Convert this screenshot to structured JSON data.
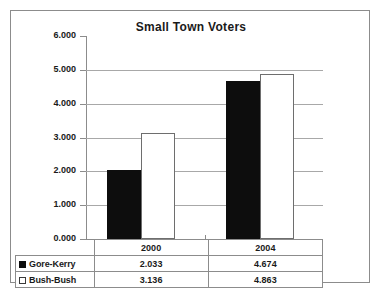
{
  "chart_data": {
    "type": "bar",
    "title": "Small Town Voters",
    "xlabel": "",
    "ylabel": "",
    "categories": [
      "2000",
      "2004"
    ],
    "series": [
      {
        "name": "Gore-Kerry",
        "values": [
          2.033,
          3.136
        ],
        "marker": "filled-square",
        "color": "#0d0d0d"
      },
      {
        "name": "Bush-Bush",
        "values": [
          4.674,
          4.863
        ],
        "marker": "open-square",
        "color": "#ffffff"
      }
    ],
    "plotted_series": [
      {
        "name": "Gore-Kerry",
        "values": [
          2.033,
          4.674
        ],
        "color": "#0d0d0d"
      },
      {
        "name": "Bush-Bush",
        "values": [
          3.136,
          4.863
        ],
        "color": "#ffffff"
      }
    ],
    "ylim": [
      0,
      6
    ],
    "ytick_values": [
      6.0,
      5.0,
      4.0,
      3.0,
      2.0,
      1.0,
      0.0
    ],
    "ytick_labels": [
      "6.000",
      "5.000",
      "4.000",
      "3.000",
      "2.000",
      "1.000",
      "0.000"
    ],
    "grid": true,
    "legend": "data-table-below"
  },
  "table": {
    "corner_label": "",
    "column_headers": [
      "2000",
      "2004"
    ],
    "rows": [
      {
        "series": "Gore-Kerry",
        "swatch": "filled-square-icon",
        "cells": [
          "2.033",
          "4.674"
        ]
      },
      {
        "series": "Bush-Bush",
        "swatch": "open-square-icon",
        "cells": [
          "3.136",
          "4.863"
        ]
      }
    ]
  },
  "caption": {
    "text": ""
  }
}
